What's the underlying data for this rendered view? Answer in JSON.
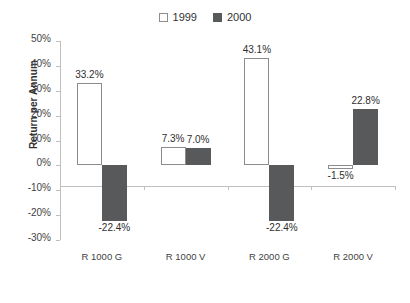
{
  "chart_data": {
    "type": "bar",
    "title": "",
    "xlabel": "",
    "ylabel": "Return per Annum",
    "ylim": [
      -30,
      50
    ],
    "grid": false,
    "legend_position": "top-center",
    "categories": [
      "R 1000 G",
      "R 1000 V",
      "R 2000 G",
      "R 2000 V"
    ],
    "ytick_labels": [
      "50%",
      "40%",
      "30%",
      "20%",
      "10%",
      "0%",
      "-10%",
      "-20%",
      "-30%"
    ],
    "ytick_values": [
      50,
      40,
      30,
      20,
      10,
      0,
      -10,
      -20,
      -30
    ],
    "series": [
      {
        "name": "1999",
        "swatch": "series-light",
        "color": "#ffffff",
        "values": [
          33.2,
          7.3,
          43.1,
          -1.5
        ],
        "labels": [
          "33.2%",
          "7.3%",
          "43.1%",
          "-1.5%"
        ]
      },
      {
        "name": "2000",
        "swatch": "series-dark",
        "color": "#58595b",
        "values": [
          -22.4,
          7.0,
          -22.4,
          22.8
        ],
        "labels": [
          "-22.4%",
          "7.0%",
          "-22.4%",
          "22.8%"
        ]
      }
    ]
  },
  "legend": {
    "entries": [
      {
        "label": "1999",
        "swatch": "series-light"
      },
      {
        "label": "2000",
        "swatch": "series-dark"
      }
    ]
  },
  "axis": {
    "y_title": "Return per Annum"
  }
}
